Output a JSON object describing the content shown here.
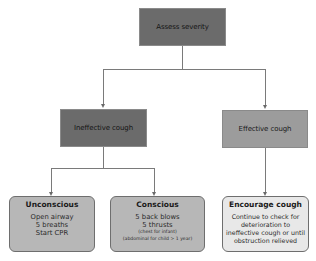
{
  "diagram": {
    "type": "flowchart",
    "nodes": {
      "root": {
        "label": "Assess severity",
        "fill": "#6b6b6b"
      },
      "ineffective": {
        "label": "Ineffective cough",
        "fill": "#6b6b6b"
      },
      "effective": {
        "label": "Effective cough",
        "fill": "#9c9c9c"
      },
      "unconscious": {
        "title": "Unconscious",
        "lines": [
          "Open airway",
          "5 breaths",
          "Start CPR"
        ],
        "fill": "#b7b7b7"
      },
      "conscious": {
        "title": "Conscious",
        "lines": [
          "5 back blows",
          "5 thrusts"
        ],
        "notes": [
          "(chest for infant)",
          "(abdominal for child > 1 year)"
        ],
        "fill": "#b7b7b7"
      },
      "encourage": {
        "title": "Encourage cough",
        "lines": [
          "Continue to check for",
          "deterioration to",
          "ineffective cough or until",
          "obstruction relieved"
        ],
        "fill": "#e8e8e8"
      }
    },
    "edges": [
      {
        "from": "root",
        "to": "ineffective"
      },
      {
        "from": "root",
        "to": "effective"
      },
      {
        "from": "ineffective",
        "to": "unconscious"
      },
      {
        "from": "ineffective",
        "to": "conscious"
      },
      {
        "from": "effective",
        "to": "encourage"
      }
    ]
  }
}
